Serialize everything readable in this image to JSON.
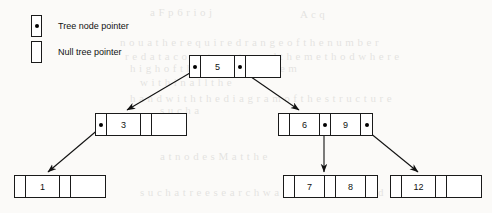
{
  "figure": {
    "background_color": "#fbfaf8",
    "line_color": "#1a1a1a"
  },
  "legend": {
    "items": [
      {
        "symbol": "filled-box",
        "label": "Tree node pointer"
      },
      {
        "symbol": "empty-box",
        "label": "Null tree pointer"
      }
    ]
  },
  "nodes": [
    {
      "id": "root",
      "keys": [
        "5"
      ],
      "cells": [
        "pointer",
        "5",
        "pointer",
        "null"
      ],
      "x": 189,
      "y": 55
    },
    {
      "id": "left-child",
      "keys": [
        "3"
      ],
      "cells": [
        "pointer",
        "3",
        "null",
        "null"
      ],
      "x": 95,
      "y": 113
    },
    {
      "id": "right-child",
      "keys": [
        "6",
        "9"
      ],
      "cells": [
        "null",
        "6",
        "pointer",
        "9",
        "pointer"
      ],
      "x": 278,
      "y": 113
    },
    {
      "id": "leaf-1",
      "keys": [
        "1"
      ],
      "cells": [
        "null",
        "1",
        "null",
        "null"
      ],
      "x": 14,
      "y": 175
    },
    {
      "id": "leaf-78",
      "keys": [
        "7",
        "8"
      ],
      "cells": [
        "null",
        "7",
        "null",
        "8",
        "null"
      ],
      "x": 283,
      "y": 175
    },
    {
      "id": "leaf-12",
      "keys": [
        "12"
      ],
      "cells": [
        "null",
        "12",
        "null",
        "null"
      ],
      "x": 390,
      "y": 175
    }
  ],
  "edges": [
    {
      "from": "root-left-pointer",
      "to": "left-child",
      "style": "diagonal-down-left"
    },
    {
      "from": "root-right-pointer",
      "to": "right-child",
      "style": "diagonal-down-right"
    },
    {
      "from": "left-child-left-pointer",
      "to": "leaf-1",
      "style": "diagonal-down-left"
    },
    {
      "from": "right-child-mid-pointer",
      "to": "leaf-78",
      "style": "vertical-down"
    },
    {
      "from": "right-child-right-pointer",
      "to": "leaf-12",
      "style": "diagonal-down-right"
    }
  ],
  "bleed_text": [
    {
      "text": "a F p 6 r  i o  j",
      "x": 150,
      "y": 6
    },
    {
      "text": "A   c   q",
      "x": 300,
      "y": 8
    },
    {
      "text": "n o u a   t h e   r e q u i r e d   r a n g e   o f   t h e   n u m b e r",
      "x": 120,
      "y": 36
    },
    {
      "text": "r e   d a t a   c o n s t r u c t s   a n d   t h e   m e t h o d   w h e r e",
      "x": 125,
      "y": 50
    },
    {
      "text": "h i g h   o f   t h e   s p e c i f i c   i t e m",
      "x": 130,
      "y": 62
    },
    {
      "text": "w i t h i n   a l l   t h e",
      "x": 140,
      "y": 76
    },
    {
      "text": "h a n d   w i t h   t h e   d i a g r a m   o f   t h e   s t r u c t u r e",
      "x": 130,
      "y": 92
    },
    {
      "text": "s u c h   a",
      "x": 160,
      "y": 104
    },
    {
      "text": "a   t   n o d e   s   M   a   t   t   h   e",
      "x": 160,
      "y": 150
    },
    {
      "text": "s u c h   a   t r e e   s e a r c h   w a s   i m p l e m e n t e d",
      "x": 140,
      "y": 186
    }
  ]
}
